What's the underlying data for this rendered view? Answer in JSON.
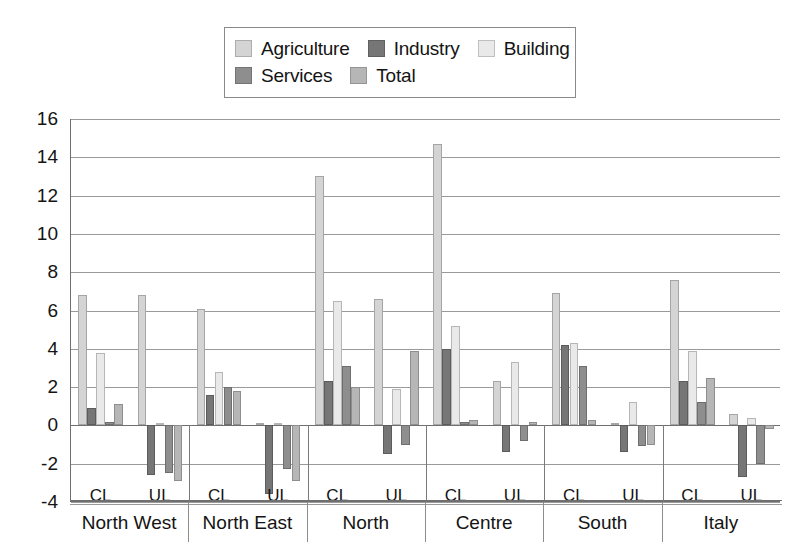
{
  "legend": {
    "items": [
      {
        "label": "Agriculture",
        "color": "#d4d4d4",
        "icon": "legend-swatch-agriculture"
      },
      {
        "label": "Industry",
        "color": "#767676",
        "icon": "legend-swatch-industry"
      },
      {
        "label": "Building",
        "color": "#e9e9e9",
        "icon": "legend-swatch-building"
      },
      {
        "label": "Services",
        "color": "#8e8e8e",
        "icon": "legend-swatch-services"
      },
      {
        "label": "Total",
        "color": "#b6b6b6",
        "icon": "legend-swatch-total"
      }
    ]
  },
  "axis": {
    "y_ticks": [
      "16",
      "14",
      "12",
      "10",
      "8",
      "6",
      "4",
      "2",
      "0",
      "-2",
      "-4"
    ],
    "sub_labels": [
      "CL",
      "UL",
      "CL",
      "UL",
      "CL",
      "UL",
      "CL",
      "UL",
      "CL",
      "UL",
      "CL",
      "UL"
    ]
  },
  "chart_data": {
    "type": "bar",
    "title": "",
    "xlabel": "",
    "ylabel": "",
    "ylim": [
      -4,
      16
    ],
    "ytick_step": 2,
    "grid": true,
    "legend_position": "top",
    "categories": [
      "North West CL",
      "North West UL",
      "North East CL",
      "North East UL",
      "North CL",
      "North UL",
      "Centre CL",
      "Centre UL",
      "South CL",
      "South UL",
      "Italy CL",
      "Italy UL"
    ],
    "groups": [
      "North West",
      "North East",
      "North",
      "Centre",
      "South",
      "Italy"
    ],
    "sub_groups": [
      "CL",
      "UL"
    ],
    "series": [
      {
        "name": "Agriculture",
        "color": "#d4d4d4",
        "values": [
          6.8,
          6.8,
          6.1,
          0.1,
          13.0,
          6.6,
          14.7,
          2.3,
          6.9,
          0.1,
          7.6,
          0.6
        ]
      },
      {
        "name": "Industry",
        "color": "#767676",
        "values": [
          0.9,
          -2.6,
          1.6,
          -3.6,
          2.3,
          -1.5,
          4.0,
          -1.4,
          4.2,
          -1.4,
          2.3,
          -2.7
        ]
      },
      {
        "name": "Building",
        "color": "#e9e9e9",
        "values": [
          3.8,
          0.1,
          2.8,
          0.1,
          6.5,
          1.9,
          5.2,
          3.3,
          4.3,
          1.2,
          3.9,
          0.4
        ]
      },
      {
        "name": "Services",
        "color": "#8e8e8e",
        "values": [
          0.2,
          -2.5,
          2.0,
          -2.3,
          3.1,
          -1.0,
          0.2,
          -0.8,
          3.1,
          -1.1,
          1.2,
          -2.0
        ]
      },
      {
        "name": "Total",
        "color": "#b6b6b6",
        "values": [
          1.1,
          -2.9,
          1.8,
          -2.9,
          2.0,
          3.9,
          0.3,
          0.2,
          0.3,
          -1.0,
          2.5,
          -0.2
        ]
      }
    ]
  }
}
